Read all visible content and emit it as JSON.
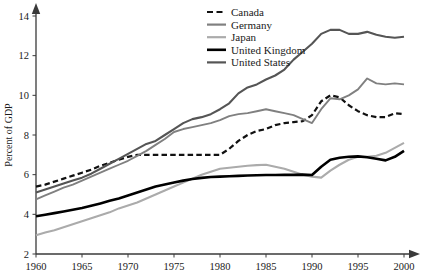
{
  "chart_data": {
    "type": "line",
    "title": "",
    "subtitle": "",
    "xlabel": "",
    "ylabel": "Percent of GDP",
    "xlim": [
      1960,
      2000
    ],
    "ylim": [
      2,
      14
    ],
    "xticks": [
      1960,
      1965,
      1970,
      1975,
      1980,
      1985,
      1990,
      1995,
      2000
    ],
    "yticks": [
      2,
      4,
      6,
      8,
      10,
      12,
      14
    ],
    "grid": false,
    "legend_position": "top-center",
    "x": [
      1960,
      1961,
      1962,
      1963,
      1964,
      1965,
      1966,
      1967,
      1968,
      1969,
      1970,
      1971,
      1972,
      1973,
      1974,
      1975,
      1976,
      1977,
      1978,
      1979,
      1980,
      1981,
      1982,
      1983,
      1984,
      1985,
      1986,
      1987,
      1988,
      1989,
      1990,
      1991,
      1992,
      1993,
      1994,
      1995,
      1996,
      1997,
      1998,
      1999,
      2000
    ],
    "series": [
      {
        "name": "Canada",
        "style": "dashed",
        "color": "#111111",
        "width": 2.2,
        "values": [
          5.4,
          5.5,
          5.65,
          5.8,
          5.95,
          6.1,
          6.25,
          6.45,
          6.6,
          6.75,
          6.9,
          7.0,
          7.0,
          7.0,
          7.0,
          7.0,
          7.0,
          7.0,
          7.0,
          7.0,
          7.0,
          7.3,
          7.7,
          8.0,
          8.2,
          8.3,
          8.5,
          8.6,
          8.65,
          8.7,
          9.0,
          9.7,
          10.0,
          9.9,
          9.5,
          9.2,
          9.0,
          8.9,
          8.9,
          9.1,
          9.05
        ]
      },
      {
        "name": "Germany",
        "style": "solid",
        "color": "#808080",
        "width": 1.9,
        "values": [
          4.75,
          4.95,
          5.15,
          5.35,
          5.5,
          5.7,
          5.9,
          6.1,
          6.3,
          6.5,
          6.7,
          6.95,
          7.2,
          7.5,
          7.8,
          8.15,
          8.3,
          8.4,
          8.5,
          8.6,
          8.75,
          8.95,
          9.05,
          9.1,
          9.2,
          9.3,
          9.2,
          9.1,
          9.0,
          8.8,
          8.6,
          9.3,
          9.85,
          9.8,
          10.0,
          10.3,
          10.85,
          10.6,
          10.55,
          10.6,
          10.55
        ]
      },
      {
        "name": "Japan",
        "style": "solid",
        "color": "#ababab",
        "width": 2.1,
        "values": [
          2.95,
          3.08,
          3.2,
          3.35,
          3.5,
          3.65,
          3.8,
          3.95,
          4.1,
          4.3,
          4.45,
          4.6,
          4.8,
          5.0,
          5.2,
          5.4,
          5.6,
          5.8,
          6.0,
          6.15,
          6.3,
          6.35,
          6.4,
          6.45,
          6.48,
          6.5,
          6.4,
          6.3,
          6.15,
          6.0,
          5.9,
          5.85,
          6.2,
          6.5,
          6.75,
          6.9,
          6.9,
          6.95,
          7.1,
          7.35,
          7.6
        ]
      },
      {
        "name": "United Kingdom",
        "style": "solid",
        "color": "#000000",
        "width": 2.6,
        "values": [
          3.9,
          3.98,
          4.06,
          4.14,
          4.23,
          4.32,
          4.43,
          4.55,
          4.68,
          4.8,
          4.95,
          5.1,
          5.25,
          5.4,
          5.5,
          5.6,
          5.7,
          5.78,
          5.84,
          5.88,
          5.9,
          5.92,
          5.94,
          5.96,
          5.97,
          5.98,
          5.98,
          5.99,
          5.99,
          6.0,
          5.98,
          6.4,
          6.75,
          6.85,
          6.9,
          6.92,
          6.88,
          6.8,
          6.72,
          6.9,
          7.2
        ]
      },
      {
        "name": "United States",
        "style": "solid",
        "color": "#555555",
        "width": 2.1,
        "values": [
          5.1,
          5.25,
          5.4,
          5.55,
          5.7,
          5.85,
          6.05,
          6.3,
          6.55,
          6.8,
          7.05,
          7.3,
          7.55,
          7.7,
          8.0,
          8.3,
          8.6,
          8.8,
          8.9,
          9.05,
          9.3,
          9.6,
          10.1,
          10.4,
          10.55,
          10.8,
          11.0,
          11.3,
          11.8,
          12.2,
          12.6,
          13.1,
          13.3,
          13.3,
          13.1,
          13.1,
          13.2,
          13.05,
          12.95,
          12.9,
          12.95
        ]
      }
    ]
  },
  "axis": {
    "y_title": "Percent of GDP",
    "y_tick_labels": [
      "2",
      "4",
      "6",
      "8",
      "10",
      "12",
      "14"
    ],
    "x_tick_labels": [
      "1960",
      "1965",
      "1970",
      "1975",
      "1980",
      "1985",
      "1990",
      "1995",
      "2000"
    ]
  },
  "legend": {
    "items": [
      {
        "label": "Canada",
        "swatch": "dashed-black"
      },
      {
        "label": "Germany",
        "swatch": "solid-gray"
      },
      {
        "label": "Japan",
        "swatch": "solid-light-gray"
      },
      {
        "label": "United Kingdom",
        "swatch": "solid-black-thick"
      },
      {
        "label": "United States",
        "swatch": "solid-dark-gray"
      }
    ]
  }
}
